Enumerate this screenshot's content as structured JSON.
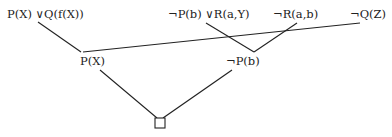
{
  "diagram": {
    "type": "resolution-refutation-tree",
    "clauses": {
      "c1": "P(X) ∨Q(f(X))",
      "c2": "¬P(b) ∨R(a,Y)",
      "c3": "¬R(a,b)",
      "c4": "¬Q(Z)",
      "r1": "P(X)",
      "r2": "¬P(b)",
      "empty": "□"
    },
    "edges": [
      {
        "from": "c1",
        "to": "r1"
      },
      {
        "from": "c4",
        "to": "r1"
      },
      {
        "from": "c2",
        "to": "r2"
      },
      {
        "from": "c3",
        "to": "r2"
      },
      {
        "from": "r1",
        "to": "empty"
      },
      {
        "from": "r2",
        "to": "empty"
      }
    ]
  }
}
